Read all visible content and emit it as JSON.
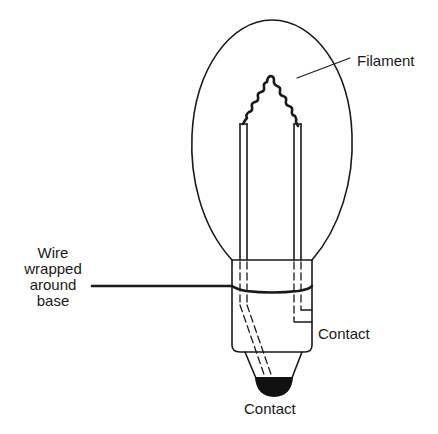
{
  "diagram": {
    "type": "labeled illustration",
    "labels": {
      "filament": "Filament",
      "wire": [
        "Wire",
        "wrapped",
        "around",
        "base"
      ],
      "contact_side": "Contact",
      "contact_bottom": "Contact"
    },
    "colors": {
      "line": "#1a1a1a",
      "background": "#ffffff",
      "contact_fill": "#111111"
    }
  }
}
